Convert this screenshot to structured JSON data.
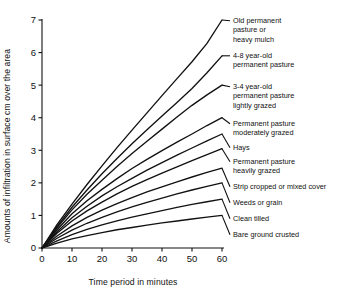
{
  "chart_data": {
    "type": "line",
    "title": "",
    "xlabel": "Time period in minutes",
    "ylabel": "Amounts of infiltration in surface cm over the area",
    "xlim": [
      0,
      60
    ],
    "ylim": [
      0,
      7
    ],
    "xticks": [
      0,
      10,
      20,
      30,
      40,
      50,
      60
    ],
    "yticks": [
      0,
      1,
      2,
      3,
      4,
      5,
      6,
      7
    ],
    "grid": false,
    "legend_position": "right-inline-labels",
    "x": [
      0,
      5,
      10,
      15,
      20,
      25,
      30,
      35,
      40,
      45,
      50,
      55,
      60
    ],
    "series": [
      {
        "name": "Old permanent pasture or heavy mulch",
        "label": "Old permanent pasture or heavy mulch",
        "values": [
          0,
          0.72,
          1.35,
          1.95,
          2.52,
          3.08,
          3.62,
          4.15,
          4.68,
          5.2,
          5.72,
          6.28,
          7.0
        ]
      },
      {
        "name": "4-8 year-old permanent pasture",
        "label": "4-8 year-old permanent pasture",
        "values": [
          0,
          0.66,
          1.25,
          1.78,
          2.28,
          2.75,
          3.2,
          3.63,
          4.05,
          4.47,
          4.9,
          5.38,
          5.9
        ]
      },
      {
        "name": "3-4 year-old permanent pasture lightly grazed",
        "label": "3-4 year-old permanent pasture lightly grazed",
        "values": [
          0,
          0.62,
          1.17,
          1.65,
          2.08,
          2.5,
          2.9,
          3.28,
          3.65,
          4.02,
          4.38,
          4.7,
          5.0
        ]
      },
      {
        "name": "Permanent pasture moderately grazed",
        "label": "Permanent pasture moderately grazed",
        "values": [
          0,
          0.56,
          1.05,
          1.45,
          1.8,
          2.13,
          2.44,
          2.72,
          2.99,
          3.25,
          3.5,
          3.76,
          4.0
        ]
      },
      {
        "name": "Hays",
        "label": "Hays",
        "values": [
          0,
          0.5,
          0.93,
          1.28,
          1.6,
          1.88,
          2.14,
          2.39,
          2.62,
          2.85,
          3.07,
          3.29,
          3.5
        ]
      },
      {
        "name": "Permanent pasture heavily grazed",
        "label": "Permanent pasture heavily grazed",
        "values": [
          0,
          0.45,
          0.83,
          1.14,
          1.41,
          1.66,
          1.89,
          2.1,
          2.3,
          2.49,
          2.68,
          2.87,
          3.05
        ]
      },
      {
        "name": "Strip cropped or mixed cover",
        "label": "Strip cropped or mixed cover",
        "values": [
          0,
          0.37,
          0.68,
          0.94,
          1.16,
          1.36,
          1.55,
          1.72,
          1.88,
          2.03,
          2.18,
          2.32,
          2.45
        ]
      },
      {
        "name": "Weeds or grain",
        "label": "Weeds or grain",
        "values": [
          0,
          0.3,
          0.55,
          0.76,
          0.94,
          1.11,
          1.26,
          1.4,
          1.53,
          1.66,
          1.78,
          1.89,
          2.0
        ]
      },
      {
        "name": "Clean tilled",
        "label": "Clean tilled",
        "values": [
          0,
          0.22,
          0.41,
          0.57,
          0.71,
          0.83,
          0.95,
          1.05,
          1.15,
          1.25,
          1.34,
          1.42,
          1.5
        ]
      },
      {
        "name": "Bare ground crusted",
        "label": "Bare ground crusted",
        "values": [
          0,
          0.15,
          0.28,
          0.38,
          0.47,
          0.56,
          0.63,
          0.7,
          0.77,
          0.83,
          0.89,
          0.95,
          1.0
        ]
      }
    ],
    "annotations": [
      {
        "text_lines": [
          "Old permanent",
          "pasture or",
          "heavy mulch"
        ],
        "anchor_series": 0
      },
      {
        "text_lines": [
          "4-8 year-old",
          "permanent pasture"
        ],
        "anchor_series": 1
      },
      {
        "text_lines": [
          "3-4 year-old",
          "permanent pasture",
          "lightly grazed"
        ],
        "anchor_series": 2
      },
      {
        "text_lines": [
          "Permanent pasture",
          "moderately grazed"
        ],
        "anchor_series": 3
      },
      {
        "text_lines": [
          "Hays"
        ],
        "anchor_series": 4
      },
      {
        "text_lines": [
          "Permanent pasture",
          "heavily grazed"
        ],
        "anchor_series": 5
      },
      {
        "text_lines": [
          "Strip cropped or mixed cover"
        ],
        "anchor_series": 6
      },
      {
        "text_lines": [
          "Weeds or grain"
        ],
        "anchor_series": 7
      },
      {
        "text_lines": [
          "Clean tilled"
        ],
        "anchor_series": 8
      },
      {
        "text_lines": [
          "Bare ground crusted"
        ],
        "anchor_series": 9
      }
    ]
  },
  "axis": {
    "x_title": "Time period in minutes",
    "y_title": "Amounts of infiltration in surface cm over the area",
    "x_tick_labels": [
      "0",
      "10",
      "20",
      "30",
      "40",
      "50",
      "60"
    ],
    "y_tick_labels": [
      "0",
      "1",
      "2",
      "3",
      "4",
      "5",
      "6",
      "7"
    ]
  },
  "colors": {
    "line": "#111111",
    "axis": "#111111",
    "background": "#ffffff",
    "text": "#111111"
  }
}
